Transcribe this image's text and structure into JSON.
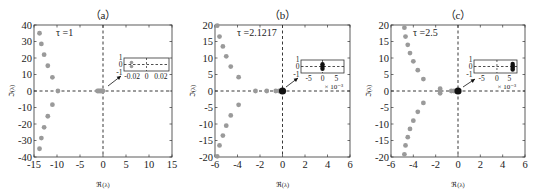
{
  "figure": {
    "width": 540,
    "height": 194,
    "colors": {
      "point": "#9a9a9a",
      "point_dark": "#111111",
      "axis": "#333333",
      "text": "#222222",
      "dash": "#222222"
    }
  },
  "chart_data": [
    {
      "type": "scatter",
      "panel_label": "（a）",
      "annotation": "τ =1",
      "xlabel": "ℜ(λ)",
      "ylabel": "ℑ(λ)",
      "xlim": [
        -15,
        15
      ],
      "ylim": [
        -40,
        40
      ],
      "xticks": [
        -15,
        -10,
        -5,
        0,
        5,
        10,
        15
      ],
      "yticks": [
        -40,
        -30,
        -20,
        -10,
        0,
        10,
        20,
        30,
        40
      ],
      "grid": false,
      "frame": {
        "left": 34,
        "top": 25,
        "right": 172,
        "bottom": 157
      },
      "points": [
        {
          "re": -13.8,
          "im": 35
        },
        {
          "re": -13.4,
          "im": 28.5
        },
        {
          "re": -12.8,
          "im": 22
        },
        {
          "re": -12.0,
          "im": 15.3
        },
        {
          "re": -11.0,
          "im": 8.3
        },
        {
          "re": -9.8,
          "im": 0
        },
        {
          "re": -11.0,
          "im": -8.3
        },
        {
          "re": -12.0,
          "im": -15.3
        },
        {
          "re": -12.8,
          "im": -22
        },
        {
          "re": -13.4,
          "im": -28.5
        },
        {
          "re": -13.8,
          "im": -35
        },
        {
          "re": -1.2,
          "im": 0
        },
        {
          "re": -0.9,
          "im": 0
        },
        {
          "re": -0.6,
          "im": 0
        },
        {
          "re": -0.3,
          "im": 0
        },
        {
          "re": -0.02,
          "im": 0
        }
      ],
      "dark_points": [],
      "inset": {
        "box": {
          "left": 124,
          "top": 58,
          "width": 45,
          "height": 13
        },
        "xlim": [
          -0.03,
          0.03
        ],
        "ylim": [
          -1,
          1
        ],
        "xticks": [
          "-0.02",
          "0",
          "0.02"
        ],
        "yticks": [
          "1",
          "0",
          "-1"
        ],
        "exponent_label": "",
        "points": [
          {
            "re": -0.02,
            "im": 0.3,
            "dark": false
          },
          {
            "re": -0.02,
            "im": -0.3,
            "dark": false
          }
        ],
        "arrow": {
          "from": [
            108,
            86
          ],
          "to": [
            121,
            76
          ]
        }
      }
    },
    {
      "type": "scatter",
      "panel_label": "（b）",
      "annotation": "τ =2.1217",
      "xlabel": "ℜ(λ)",
      "ylabel": "ℑ(λ)",
      "xlim": [
        -6,
        6
      ],
      "ylim": [
        -20,
        20
      ],
      "xticks": [
        -6,
        -4,
        -2,
        0,
        2,
        4,
        6
      ],
      "yticks": [
        -20,
        -15,
        -10,
        -5,
        0,
        5,
        10,
        15,
        20
      ],
      "grid": false,
      "frame": {
        "left": 215,
        "top": 25,
        "right": 350,
        "bottom": 157
      },
      "points": [
        {
          "re": -5.8,
          "im": 19.8
        },
        {
          "re": -5.6,
          "im": 16.5
        },
        {
          "re": -5.3,
          "im": 13.5
        },
        {
          "re": -5.0,
          "im": 10.5
        },
        {
          "re": -4.6,
          "im": 7.4
        },
        {
          "re": -3.9,
          "im": 4.2
        },
        {
          "re": -3.9,
          "im": -4.2
        },
        {
          "re": -4.6,
          "im": -7.4
        },
        {
          "re": -5.0,
          "im": -10.5
        },
        {
          "re": -5.3,
          "im": -13.5
        },
        {
          "re": -5.6,
          "im": -16.5
        },
        {
          "re": -5.8,
          "im": -19.8
        },
        {
          "re": -2.4,
          "im": 0
        },
        {
          "re": -1.4,
          "im": 0
        },
        {
          "re": -0.6,
          "im": 0
        },
        {
          "re": -0.3,
          "im": 0
        }
      ],
      "dark_points": [
        {
          "re": 0,
          "im": 0
        }
      ],
      "inset": {
        "box": {
          "left": 301,
          "top": 60,
          "width": 43,
          "height": 13
        },
        "xlim": [
          -0.008,
          0.008
        ],
        "ylim": [
          -1,
          1
        ],
        "xticks": [
          "-5",
          "0",
          "5"
        ],
        "yticks": [
          "1",
          "0",
          "-1"
        ],
        "exponent_label": "× 10⁻³",
        "points": [
          {
            "re": 0,
            "im": 0.35,
            "dark": true
          },
          {
            "re": 0,
            "im": 0,
            "dark": true
          },
          {
            "re": 0,
            "im": -0.35,
            "dark": true
          }
        ],
        "arrow": {
          "from": [
            286,
            87
          ],
          "to": [
            298,
            78
          ]
        }
      }
    },
    {
      "type": "scatter",
      "panel_label": "（c）",
      "annotation": "τ =2.5",
      "xlabel": "ℜ(λ)",
      "ylabel": "ℑ(λ)",
      "xlim": [
        -6,
        6
      ],
      "ylim": [
        -20,
        20
      ],
      "xticks": [
        -6,
        -4,
        -2,
        0,
        2,
        4,
        6
      ],
      "yticks": [
        -20,
        -15,
        -10,
        -5,
        0,
        5,
        10,
        15,
        20
      ],
      "grid": false,
      "frame": {
        "left": 391,
        "top": 25,
        "right": 525,
        "bottom": 157
      },
      "points": [
        {
          "re": -4.8,
          "im": 19.2
        },
        {
          "re": -4.7,
          "im": 16.5
        },
        {
          "re": -4.5,
          "im": 14.0
        },
        {
          "re": -4.3,
          "im": 11.5
        },
        {
          "re": -4.0,
          "im": 9.0
        },
        {
          "re": -3.6,
          "im": 6.3
        },
        {
          "re": -3.1,
          "im": 3.6
        },
        {
          "re": -3.1,
          "im": -3.6
        },
        {
          "re": -3.6,
          "im": -6.3
        },
        {
          "re": -4.0,
          "im": -9.0
        },
        {
          "re": -4.3,
          "im": -11.5
        },
        {
          "re": -4.5,
          "im": -14.0
        },
        {
          "re": -4.7,
          "im": -16.5
        },
        {
          "re": -4.8,
          "im": -19.2
        },
        {
          "re": -1.6,
          "im": 0.7
        },
        {
          "re": -1.6,
          "im": 0
        },
        {
          "re": -1.6,
          "im": -0.7
        },
        {
          "re": -0.6,
          "im": 0
        },
        {
          "re": -0.35,
          "im": 0
        }
      ],
      "dark_points": [
        {
          "re": 0,
          "im": 0
        }
      ],
      "inset": {
        "box": {
          "left": 474,
          "top": 60,
          "width": 43,
          "height": 13
        },
        "xlim": [
          -0.008,
          0.007
        ],
        "ylim": [
          -1,
          1
        ],
        "xticks": [
          "-5",
          "0",
          "5"
        ],
        "yticks": [
          "1",
          "0",
          "-1"
        ],
        "exponent_label": "× 10⁻³",
        "points": [
          {
            "re": 0.0055,
            "im": 0.4,
            "dark": true
          },
          {
            "re": 0.0055,
            "im": 0.1,
            "dark": true
          },
          {
            "re": 0.0055,
            "im": -0.2,
            "dark": true
          },
          {
            "re": 0.0055,
            "im": -0.45,
            "dark": true
          }
        ],
        "arrow": {
          "from": [
            463,
            87
          ],
          "to": [
            475,
            79
          ]
        }
      }
    }
  ]
}
